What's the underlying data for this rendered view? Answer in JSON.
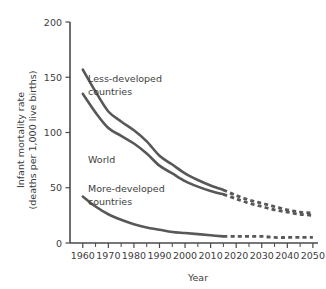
{
  "chart_data": {
    "type": "line",
    "title": "",
    "xlabel": "Year",
    "ylabel": "Infant mortality rate (deaths per 1,000 live births)",
    "ylabel_line1": "Infant mortality rate",
    "ylabel_line2": "(deaths per 1,000 live births)",
    "xlim": [
      1955,
      2052
    ],
    "ylim": [
      0,
      200
    ],
    "grid": false,
    "legend_position": "inline-labels",
    "y_ticks": [
      0,
      50,
      100,
      150,
      200
    ],
    "y_tick_labels": [
      "0",
      "50",
      "100",
      "150",
      "200"
    ],
    "x_ticks": [
      1960,
      1970,
      1980,
      1990,
      2000,
      2010,
      2020,
      2030,
      2040,
      2050
    ],
    "x_tick_labels": [
      "1960",
      "1970",
      "1980",
      "1990",
      "2000",
      "2010",
      "2020",
      "2030",
      "2040",
      "2050"
    ],
    "x_minor_ticks": [
      1965,
      1975,
      1985,
      1995,
      2005,
      2015,
      2025,
      2035,
      2045
    ],
    "projection_start_year": 2015,
    "line_color": "#585858",
    "series": [
      {
        "name": "Less-developed countries",
        "label": "Less-developed countries",
        "label_line1": "Less-developed",
        "label_line2": "countries",
        "color": "#585858",
        "x": [
          1960,
          1965,
          1970,
          1975,
          1980,
          1985,
          1990,
          1995,
          2000,
          2005,
          2010,
          2015,
          2020,
          2025,
          2030,
          2035,
          2040,
          2045,
          2050
        ],
        "values": [
          157,
          137,
          119,
          110,
          102,
          92,
          79,
          71,
          63,
          57,
          52,
          48,
          43,
          39,
          36,
          33,
          30,
          28,
          27
        ]
      },
      {
        "name": "World",
        "label": "World",
        "color": "#585858",
        "x": [
          1960,
          1965,
          1970,
          1975,
          1980,
          1985,
          1990,
          1995,
          2000,
          2005,
          2010,
          2015,
          2020,
          2025,
          2030,
          2035,
          2040,
          2045,
          2050
        ],
        "values": [
          135,
          118,
          104,
          97,
          90,
          81,
          70,
          63,
          56,
          51,
          47,
          44,
          40,
          36,
          33,
          30,
          28,
          26,
          25
        ]
      },
      {
        "name": "More-developed countries",
        "label": "More-developed countries",
        "label_line1": "More-developed",
        "label_line2": "countries",
        "color": "#585858",
        "x": [
          1960,
          1965,
          1970,
          1975,
          1980,
          1985,
          1990,
          1995,
          2000,
          2005,
          2010,
          2015,
          2020,
          2025,
          2030,
          2035,
          2040,
          2045,
          2050
        ],
        "values": [
          42,
          33,
          26,
          21,
          17,
          14,
          12,
          10,
          9,
          8,
          7,
          6,
          6,
          6,
          6,
          5,
          5,
          5,
          5
        ]
      }
    ]
  }
}
